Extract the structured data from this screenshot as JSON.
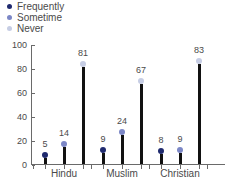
{
  "chart_data": {
    "type": "bar",
    "title": "",
    "xlabel": "",
    "ylabel": "",
    "categories": [
      "Hindu",
      "Muslim",
      "Christian"
    ],
    "series": [
      {
        "name": "Frequently",
        "color": "#1f2a6e",
        "values": [
          5,
          9,
          8
        ]
      },
      {
        "name": "Sometime",
        "color": "#7c87c6",
        "values": [
          14,
          24,
          9
        ]
      },
      {
        "name": "Never",
        "color": "#c6cde4",
        "values": [
          81,
          67,
          83
        ]
      }
    ],
    "ylim": [
      0,
      100
    ],
    "yticks": [
      0,
      20,
      40,
      60,
      80,
      100
    ],
    "ytick_labels": [
      "0",
      "20",
      "40",
      "60",
      "80",
      "100"
    ],
    "grid": false,
    "legend_position": "top-left",
    "bar_color": "#111111",
    "axis_color": "#6a6a6a",
    "text_color": "#4a4a4a"
  },
  "legend": {
    "items": [
      {
        "label": "Frequently",
        "icon": "legend-dot-icon"
      },
      {
        "label": "Sometime",
        "icon": "legend-dot-icon"
      },
      {
        "label": "Never",
        "icon": "legend-dot-icon"
      }
    ]
  }
}
